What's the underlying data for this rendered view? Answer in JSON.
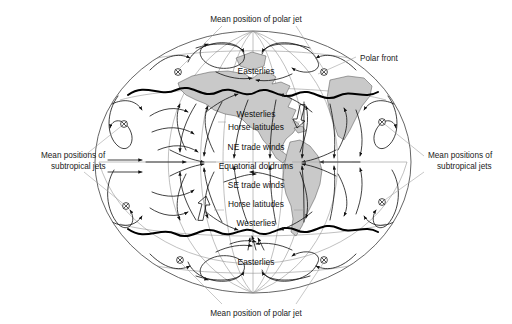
{
  "figure": {
    "type": "diagram",
    "background_color": "#ffffff",
    "land_fill_color": "#c9c9c9",
    "grid_color": "#8c8c8c",
    "front_color": "#000000"
  },
  "callouts": {
    "top_polar_jet": "Mean position of polar jet",
    "bottom_polar_jet": "Mean position of polar jet",
    "polar_front": "Polar front",
    "left_subtropical": "Mean positions of\nsubtropical jets",
    "left_subtropical_line1": "Mean positions of",
    "left_subtropical_line2": "subtropical jets",
    "right_subtropical_line1": "Mean positions of",
    "right_subtropical_line2": "subtropical jets"
  },
  "wind_belts": [
    {
      "id": "n-easterlies",
      "label": "Easterlies",
      "hemisphere": "north"
    },
    {
      "id": "n-westerlies",
      "label": "Westerlies",
      "hemisphere": "north"
    },
    {
      "id": "n-horse",
      "label": "Horse latitudes",
      "hemisphere": "north"
    },
    {
      "id": "ne-trades",
      "label": "NE trade winds",
      "hemisphere": "north"
    },
    {
      "id": "doldrums",
      "label": "Equatorial doldrums",
      "hemisphere": "equator"
    },
    {
      "id": "se-trades",
      "label": "SE trade winds",
      "hemisphere": "south"
    },
    {
      "id": "s-horse",
      "label": "Horse latitudes",
      "hemisphere": "south"
    },
    {
      "id": "s-westerlies",
      "label": "Westerlies",
      "hemisphere": "south"
    },
    {
      "id": "s-easterlies",
      "label": "Easterlies",
      "hemisphere": "south"
    }
  ],
  "jet_markers": {
    "symbol": "circled-x",
    "count": 6,
    "meaning": "jet stream into page"
  }
}
